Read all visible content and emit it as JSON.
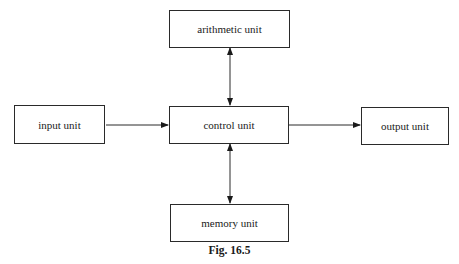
{
  "diagram": {
    "title": "",
    "nodes": [
      {
        "id": "arithmetic",
        "label": "arithmetic unit"
      },
      {
        "id": "input",
        "label": "input unit"
      },
      {
        "id": "control",
        "label": "control unit"
      },
      {
        "id": "output",
        "label": "output unit"
      },
      {
        "id": "memory",
        "label": "memory unit"
      }
    ],
    "edges": [
      {
        "from": "input",
        "to": "control",
        "direction": "one-way"
      },
      {
        "from": "control",
        "to": "output",
        "direction": "one-way"
      },
      {
        "from": "control",
        "to": "arithmetic",
        "direction": "bidirectional"
      },
      {
        "from": "control",
        "to": "memory",
        "direction": "bidirectional"
      }
    ],
    "caption": "Fig. 16.5",
    "colors": {
      "line": "#2a2a2a",
      "background": "#ffffff"
    }
  }
}
